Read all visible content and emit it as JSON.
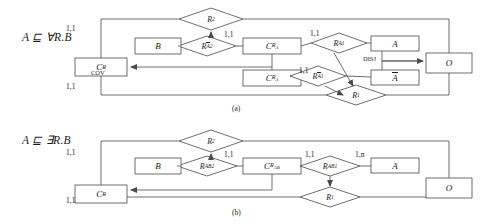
{
  "figure": {
    "caption_a": "(a)",
    "caption_b": "(b)"
  },
  "diagram_a": {
    "axiom": "A ⊑ ∀R.B",
    "entities": [
      {
        "id": "CR",
        "label": "C",
        "sub": "R",
        "x": 75,
        "y": 58,
        "w": 52,
        "h": 18
      },
      {
        "id": "B",
        "label": "B",
        "sub": "",
        "x": 135,
        "y": 38,
        "w": 46,
        "h": 16
      },
      {
        "id": "CRA",
        "label": "C",
        "sub": "Rₐ",
        "x": 243,
        "y": 38,
        "w": 58,
        "h": 16
      },
      {
        "id": "CRAb",
        "label": "C",
        "sub": "RĀ",
        "x": 243,
        "y": 70,
        "w": 58,
        "h": 16
      },
      {
        "id": "A",
        "label": "A",
        "sub": "",
        "x": 371,
        "y": 36,
        "w": 48,
        "h": 15
      },
      {
        "id": "Abar",
        "label": "Ā",
        "sub": "",
        "x": 371,
        "y": 70,
        "w": 48,
        "h": 15
      },
      {
        "id": "O",
        "label": "O",
        "sub": "",
        "x": 426,
        "y": 53,
        "w": 46,
        "h": 20
      }
    ],
    "relationships": [
      {
        "id": "R2",
        "label": "R",
        "sub": "2",
        "cx": 211,
        "cy": 19,
        "rx": 32,
        "ry": 11
      },
      {
        "id": "RA2",
        "label": "R",
        "sub": "Ā2",
        "cx": 207,
        "cy": 46,
        "rx": 29,
        "ry": 10
      },
      {
        "id": "RA1",
        "label": "R",
        "sub": "A1",
        "cx": 339,
        "cy": 43,
        "rx": 28,
        "ry": 10
      },
      {
        "id": "RAb1",
        "label": "R",
        "sub": "Ā1",
        "cx": 318,
        "cy": 76,
        "rx": 28,
        "ry": 10
      },
      {
        "id": "R1",
        "label": "R",
        "sub": "1",
        "cx": 356,
        "cy": 95,
        "rx": 30,
        "ry": 10
      }
    ],
    "cardinalities": [
      {
        "text": "1,1",
        "x": 66,
        "y": 28
      },
      {
        "text": "1,1",
        "x": 66,
        "y": 86
      },
      {
        "text": "1,1",
        "x": 228,
        "y": 34
      },
      {
        "text": "1,1",
        "x": 314,
        "y": 33
      },
      {
        "text": "1,1",
        "x": 302,
        "y": 69
      }
    ],
    "annotations": [
      {
        "text": "COV",
        "x": 95,
        "y": 72
      },
      {
        "text": "DISJ",
        "x": 366,
        "y": 59
      }
    ]
  },
  "diagram_b": {
    "axiom": "A ⊑ ∃R.B",
    "entities": [
      {
        "id": "CR",
        "label": "C",
        "sub": "R",
        "x": 75,
        "y": 185,
        "w": 52,
        "h": 18
      },
      {
        "id": "B",
        "label": "B",
        "sub": "",
        "x": 135,
        "y": 158,
        "w": 46,
        "h": 16
      },
      {
        "id": "CRAB",
        "label": "C",
        "sub": "Rₐʙ",
        "x": 243,
        "y": 158,
        "w": 58,
        "h": 16
      },
      {
        "id": "A",
        "label": "A",
        "sub": "",
        "x": 371,
        "y": 158,
        "w": 48,
        "h": 15
      },
      {
        "id": "O",
        "label": "O",
        "sub": "",
        "x": 426,
        "y": 178,
        "w": 46,
        "h": 20
      }
    ],
    "relationships": [
      {
        "id": "R2",
        "label": "R",
        "sub": "2",
        "cx": 211,
        "cy": 141,
        "rx": 32,
        "ry": 11
      },
      {
        "id": "RAB2",
        "label": "R",
        "sub": "AB2",
        "cx": 207,
        "cy": 166,
        "rx": 30,
        "ry": 10
      },
      {
        "id": "RAB1",
        "label": "R",
        "sub": "AB1",
        "cx": 330,
        "cy": 166,
        "rx": 30,
        "ry": 10
      },
      {
        "id": "R1",
        "label": "R",
        "sub": "1",
        "cx": 330,
        "cy": 197,
        "rx": 30,
        "ry": 10
      }
    ],
    "cardinalities": [
      {
        "text": "1,1",
        "x": 66,
        "y": 152
      },
      {
        "text": "1,1",
        "x": 66,
        "y": 200
      },
      {
        "text": "1,1",
        "x": 228,
        "y": 154
      },
      {
        "text": "1,1",
        "x": 309,
        "y": 154
      },
      {
        "text": "1,n",
        "x": 358,
        "y": 154
      }
    ],
    "annotations": []
  },
  "style": {
    "line_color": "#4a4a4a",
    "text_color": "#1a1a1a",
    "background": "#ffffff"
  }
}
